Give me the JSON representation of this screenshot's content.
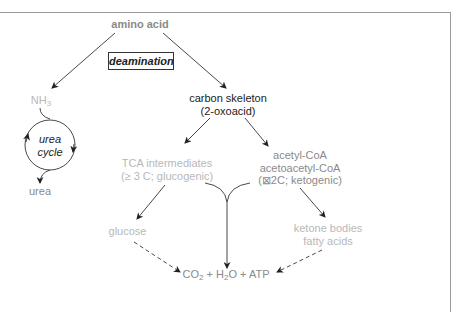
{
  "diagram": {
    "nodes": {
      "amino_acid": "amino acid",
      "deamination": "deamination",
      "nh3": {
        "base": "NH",
        "sub": "3"
      },
      "urea_cycle": {
        "line1": "urea",
        "line2": "cycle"
      },
      "urea": "urea",
      "carbon_skeleton": {
        "line1": "carbon skeleton",
        "line2": "(2-oxoacid)"
      },
      "tca": {
        "line1": "TCA intermediates",
        "line2": "(≥ 3 C; glucogenic)"
      },
      "acetyl": {
        "line1": "acetyl-CoA",
        "line2": "acetoacetyl-CoA",
        "line3": "(⊠2C; ketogenic)"
      },
      "glucose": "glucose",
      "ketone": {
        "line1": "ketone bodies",
        "line2": "fatty acids"
      },
      "products": {
        "co": "CO",
        "co_sub": "2",
        "plus1": " + H",
        "h_sub": "2",
        "rest": "O + ATP"
      }
    },
    "edges": [
      {
        "from": "amino acid",
        "to": "NH3",
        "style": "solid"
      },
      {
        "from": "amino acid",
        "to": "carbon skeleton",
        "style": "solid"
      },
      {
        "from": "NH3",
        "to": "urea cycle",
        "style": "solid"
      },
      {
        "from": "urea cycle",
        "to": "urea",
        "style": "solid"
      },
      {
        "from": "carbon skeleton",
        "to": "TCA intermediates",
        "style": "solid"
      },
      {
        "from": "carbon skeleton",
        "to": "acetyl-CoA",
        "style": "solid"
      },
      {
        "from": "TCA intermediates",
        "to": "glucose",
        "style": "solid"
      },
      {
        "from": "acetyl-CoA",
        "to": "ketone bodies",
        "style": "solid"
      },
      {
        "from": "TCA intermediates + acetyl-CoA",
        "to": "CO2 + H2O + ATP",
        "style": "solid"
      },
      {
        "from": "glucose",
        "to": "CO2 + H2O + ATP",
        "style": "dashed"
      },
      {
        "from": "ketone bodies",
        "to": "CO2 + H2O + ATP",
        "style": "dashed"
      }
    ],
    "colors": {
      "dark": "#222222",
      "gray": "#8a8a8a",
      "light": "#b8b8b8",
      "frame": "#9a9a9a"
    }
  }
}
